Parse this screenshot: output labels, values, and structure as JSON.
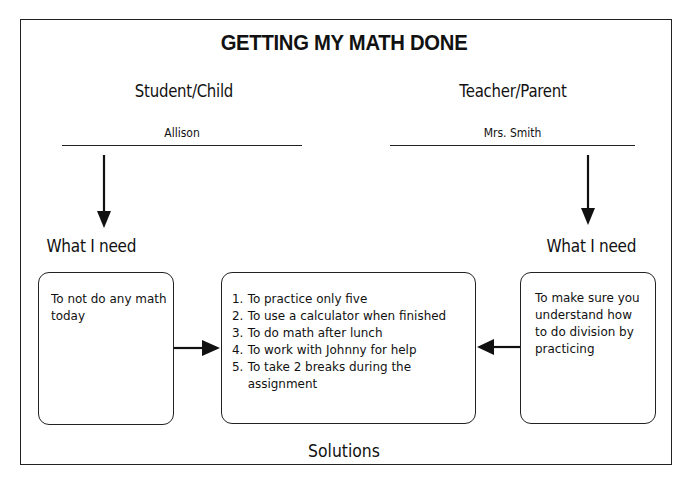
{
  "title": "GETTING MY MATH DONE",
  "student": {
    "role_label": "Student/Child",
    "name": "Allison",
    "need_label": "What I need",
    "need_text_lines": [
      "To not do any math",
      "today"
    ]
  },
  "teacher": {
    "role_label": "Teacher/Parent",
    "name": "Mrs. Smith",
    "need_label": "What I need",
    "need_text_lines": [
      "To make sure you",
      "understand how",
      "to do division by",
      "practicing"
    ]
  },
  "solutions": {
    "label": "Solutions",
    "items": [
      {
        "num": "1.",
        "lines": [
          "To practice only five"
        ]
      },
      {
        "num": "2.",
        "lines": [
          "To use a calculator when finished"
        ]
      },
      {
        "num": "3.",
        "lines": [
          "To do math after lunch"
        ]
      },
      {
        "num": "4.",
        "lines": [
          "To work with Johnny for help"
        ]
      },
      {
        "num": "5.",
        "lines": [
          "To take 2 breaks during the",
          "assignment"
        ]
      }
    ]
  },
  "colors": {
    "stroke": "#222222",
    "background": "#ffffff",
    "text": "#111111"
  }
}
